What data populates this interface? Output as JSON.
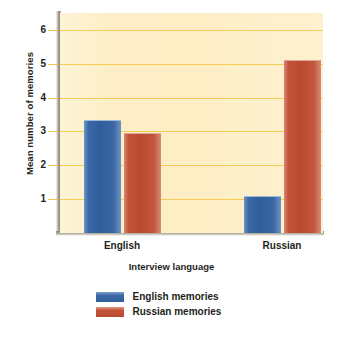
{
  "chart_data": {
    "type": "bar",
    "title": "",
    "subtitle": "",
    "xlabel": "Interview language",
    "ylabel": "Mean number of memories",
    "categories": [
      "English",
      "Russian"
    ],
    "series": [
      {
        "name": "English memories",
        "values": [
          3.35,
          1.1
        ],
        "color": "#2f5e9d"
      },
      {
        "name": "Russian memories",
        "values": [
          2.95,
          5.1
        ],
        "color": "#b94a31"
      }
    ],
    "ylim": [
      0,
      6.5
    ],
    "yticks": [
      1,
      2,
      3,
      4,
      5,
      6
    ],
    "ytick_labels": [
      "1",
      "2",
      "3",
      "4",
      "5",
      "6"
    ],
    "grid": true,
    "grid_color": "#f2c642",
    "legend_position": "bottom-center",
    "plot_background": "#fdeec6",
    "figure_background": "#ffffff"
  },
  "axes": {
    "y_title": "Mean number of memories",
    "x_title": "Interview language",
    "tick_1": "1",
    "tick_2": "2",
    "tick_3": "3",
    "tick_4": "4",
    "tick_5": "5",
    "tick_6": "6",
    "cat_english": "English",
    "cat_russian": "Russian"
  },
  "legend": {
    "items": [
      {
        "label": "English memories",
        "color": "#2f5e9d"
      },
      {
        "label": "Russian memories",
        "color": "#b94a31"
      }
    ]
  }
}
